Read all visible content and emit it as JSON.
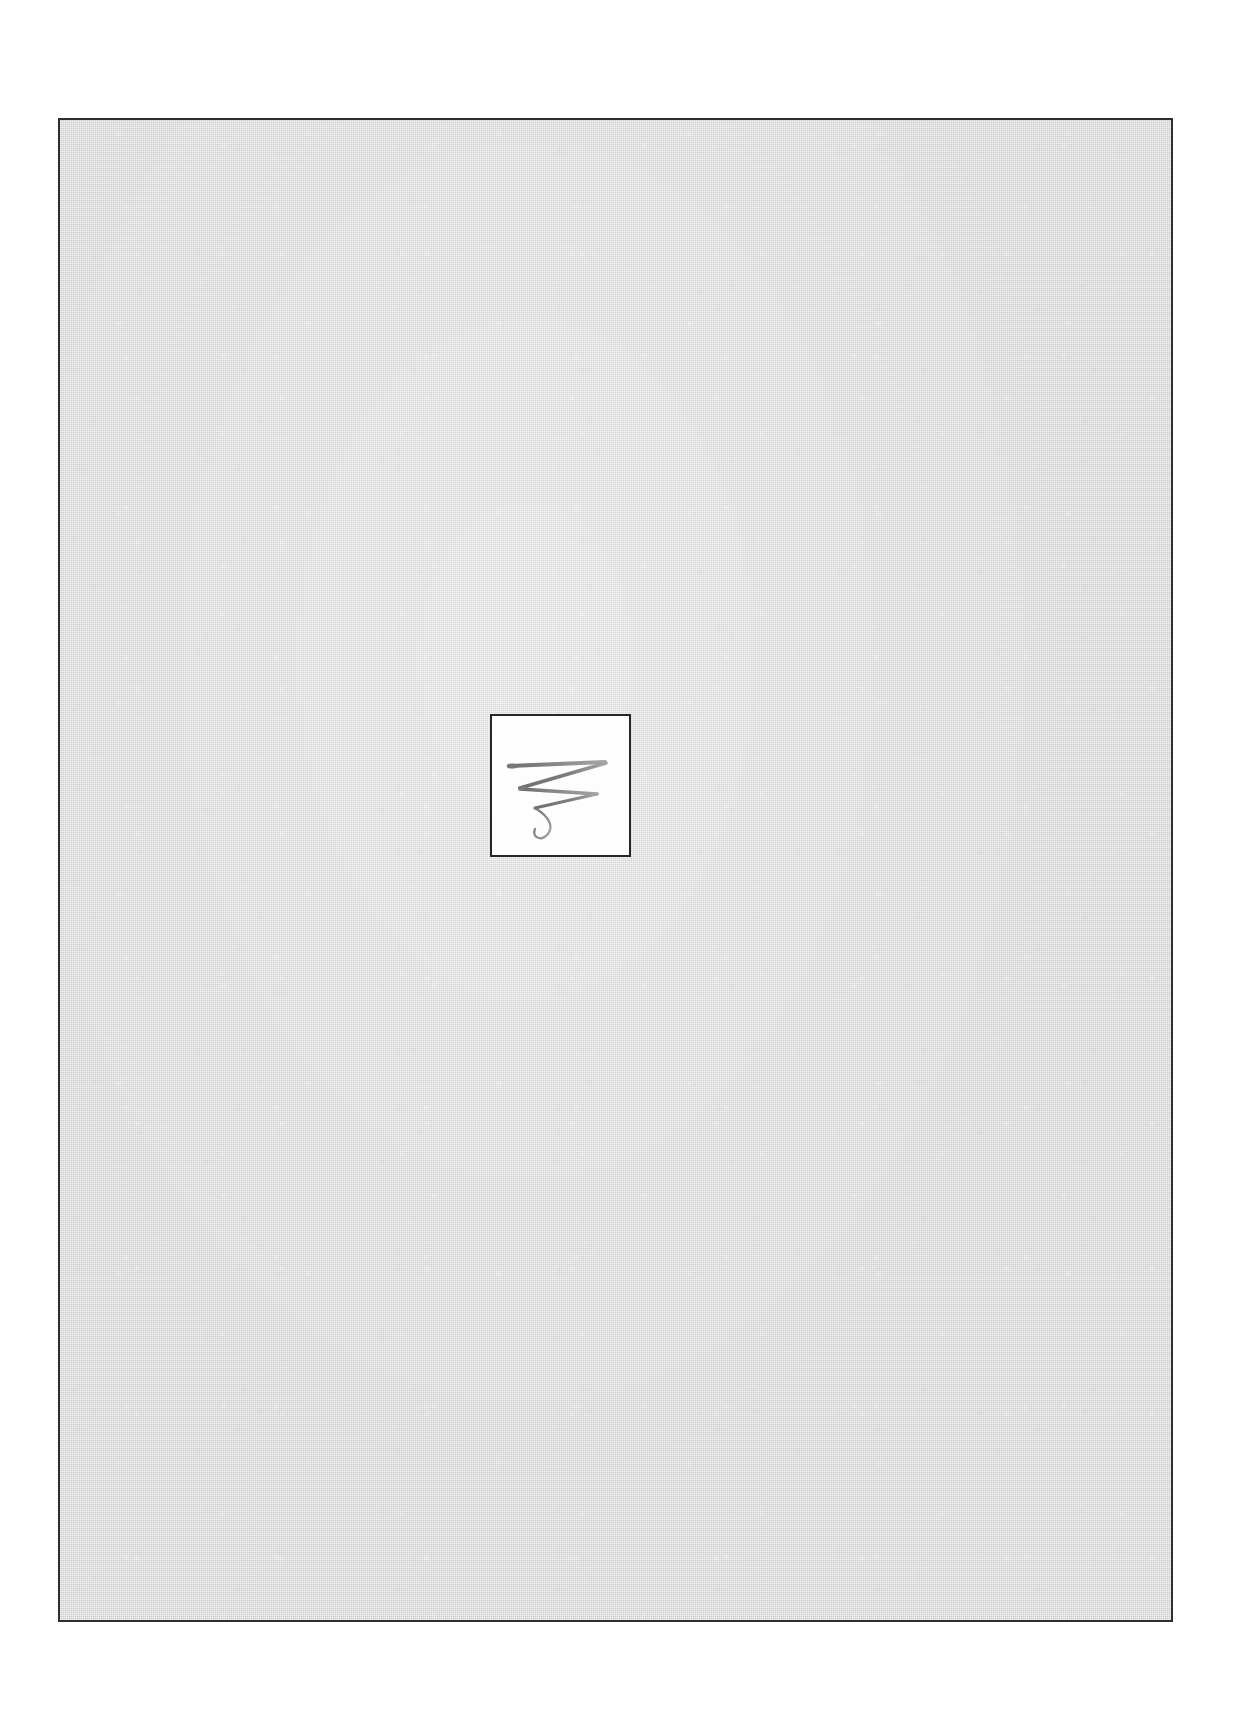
{
  "document": {
    "title": "Scanned sheet with centered drawing",
    "page_background": "#ffffff",
    "width_px": 1234,
    "height_px": 1728
  },
  "sheet": {
    "name": "scanned-sheet",
    "fill_color": "#d4d4d4",
    "border_color": "#2e2e2e",
    "border_width_px": 2,
    "left_px": 58,
    "top_px": 118,
    "width_px": 1115,
    "height_px": 1504,
    "texture": "paper-grain",
    "label": ""
  },
  "artwork": {
    "name": "centered-drawing-card",
    "fill_color": "#fdfdfd",
    "border_color": "#262626",
    "border_width_px": 2,
    "left_px": 488,
    "top_px": 712,
    "width_px": 141,
    "height_px": 143,
    "caption": "",
    "drawing": {
      "icon_name": "zigzag-scribble-icon",
      "description": "Gray pencil zigzag stroke ending in a small downward curl",
      "stroke_color": "#8a8a8a",
      "stroke_color_dark": "#6f6f6f",
      "stroke_color_light": "#a8a8a8",
      "stroke_count": 1,
      "path": "M 18 52 L 112 48 L 30 72 L 104 76 L 42 92 C 56 100 60 110 52 118 C 47 123 40 120 42 112"
    }
  },
  "annotations": {
    "visible_text": [],
    "note": "No text is present anywhere in the image."
  }
}
